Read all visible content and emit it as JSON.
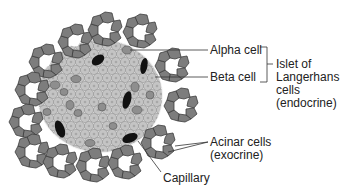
{
  "figure": {
    "colors": {
      "acinar_fill": "#7d7d7d",
      "acinar_stroke": "#3e3e3e",
      "islet_cell_fill": "#c4c4c4",
      "islet_cell_stroke": "#9a9a9a",
      "alpha_cell_fill": "#8e8e8e",
      "capillary_fill": "#111111",
      "label_color": "#222222",
      "leader_line": "#333333"
    }
  },
  "labels": {
    "alpha_cell": "Alpha cell",
    "beta_cell": "Beta cell",
    "islet_group": [
      "Islet of",
      "Langerhans",
      "cells",
      "(endocrine)"
    ],
    "acinar": [
      "Acinar cells",
      "(exocrine)"
    ],
    "capillary": "Capillary"
  }
}
